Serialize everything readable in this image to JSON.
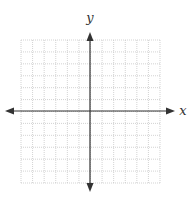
{
  "diagram": {
    "type": "coordinate-plane",
    "x_label": "x",
    "y_label": "y",
    "grid": {
      "left": 21,
      "top": 40,
      "right": 160,
      "bottom": 183,
      "columns": 12,
      "rows": 12,
      "line_color": "#c8c8c8",
      "style": "dotted"
    },
    "axes": {
      "origin_x": 90,
      "origin_y": 111,
      "x_start": 5,
      "x_end": 175,
      "y_start": 32,
      "y_end": 192,
      "color": "#333333"
    }
  }
}
